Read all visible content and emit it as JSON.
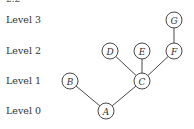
{
  "header": {
    "cut_text": "2.2"
  },
  "levels": [
    {
      "label": "Level 3",
      "y": 20
    },
    {
      "label": "Level 2",
      "y": 51
    },
    {
      "label": "Level 1",
      "y": 81
    },
    {
      "label": "Level 0",
      "y": 111
    }
  ],
  "nodes": [
    {
      "id": "A",
      "label": "A",
      "x": 106,
      "y": 111,
      "level": 0
    },
    {
      "id": "B",
      "label": "B",
      "x": 70,
      "y": 81,
      "level": 1
    },
    {
      "id": "C",
      "label": "C",
      "x": 142,
      "y": 81,
      "level": 1
    },
    {
      "id": "D",
      "label": "D",
      "x": 110,
      "y": 51,
      "level": 2
    },
    {
      "id": "E",
      "label": "E",
      "x": 142,
      "y": 51,
      "level": 2
    },
    {
      "id": "F",
      "label": "F",
      "x": 174,
      "y": 51,
      "level": 2
    },
    {
      "id": "G",
      "label": "G",
      "x": 174,
      "y": 20,
      "level": 3
    }
  ],
  "edges": [
    {
      "from": "A",
      "to": "B"
    },
    {
      "from": "A",
      "to": "C"
    },
    {
      "from": "C",
      "to": "D"
    },
    {
      "from": "C",
      "to": "E"
    },
    {
      "from": "C",
      "to": "F"
    },
    {
      "from": "F",
      "to": "G"
    }
  ],
  "style": {
    "stroke": "#333333",
    "node_radius": 8
  }
}
